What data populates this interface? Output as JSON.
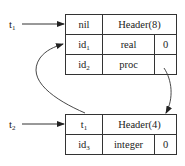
{
  "diagram": {
    "pointers": [
      {
        "id": "t1",
        "base": "t",
        "sub": "1",
        "target": "table1"
      },
      {
        "id": "t2",
        "base": "t",
        "sub": "2",
        "target": "table2"
      }
    ],
    "table1": {
      "header": {
        "link": "nil",
        "label": "Header(8)"
      },
      "rows": [
        {
          "name_base": "id",
          "name_sub": "1",
          "type": "real",
          "offset": "0"
        },
        {
          "name_base": "id",
          "name_sub": "2",
          "type": "proc",
          "offset": ""
        }
      ]
    },
    "table2": {
      "header": {
        "link_base": "t",
        "link_sub": "1",
        "label": "Header(4)"
      },
      "rows": [
        {
          "name_base": "id",
          "name_sub": "3",
          "type": "integer",
          "offset": "0"
        }
      ]
    },
    "edges": [
      {
        "from": "t1",
        "to": "table1.header"
      },
      {
        "from": "t2",
        "to": "table2.header"
      },
      {
        "from": "table2.header.link",
        "to": "table1.rows.0",
        "style": "curved"
      },
      {
        "from": "table1.rows.1.offset",
        "to": "table2",
        "style": "curved"
      }
    ],
    "colors": {
      "line": "#333333",
      "background": "#ffffff"
    }
  }
}
